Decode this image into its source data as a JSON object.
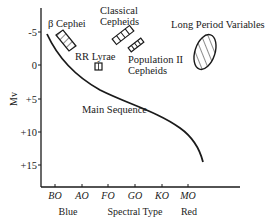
{
  "diagram": {
    "title": "",
    "y_axis": {
      "label": "Mv",
      "ticks": [
        "-5",
        "0",
        "+5",
        "+10",
        "+15"
      ]
    },
    "x_axis": {
      "label": "Spectral Type",
      "ticks": [
        "BO",
        "AO",
        "FO",
        "GO",
        "KO",
        "MO"
      ],
      "left_label": "Blue",
      "right_label": "Red"
    },
    "regions": [
      {
        "name": "β Cephei",
        "shape": "hatched-rectangle"
      },
      {
        "name": "Classical Cepheids",
        "line1": "Classical",
        "line2": "Cepheids",
        "shape": "segmented-bar"
      },
      {
        "name": "RR Lyrae",
        "shape": "small-rectangle"
      },
      {
        "name": "Population II Cepheids",
        "line1": "Population II",
        "line2": "Cepheids",
        "shape": "segmented-bar"
      },
      {
        "name": "Long Period Variables",
        "shape": "hatched-ellipse"
      }
    ],
    "curve_label": "Main Sequence",
    "colors": {
      "ink": "#1a1a1a",
      "background": "#ffffff"
    }
  }
}
